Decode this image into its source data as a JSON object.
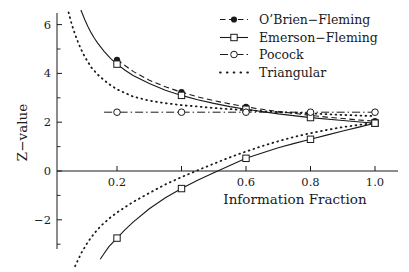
{
  "figure": {
    "width": 409,
    "height": 272,
    "background": "#ffffff",
    "ink_color": "#1a1a1a"
  },
  "chart_data": {
    "type": "line",
    "title": "",
    "xlabel": "Information Fraction",
    "ylabel": "Z−value",
    "legend_position": "top-right",
    "grid": false,
    "x_axis": {
      "range": [
        0.02,
        1.06
      ],
      "line_y_at": 0,
      "ticks": [
        {
          "v": 0.2,
          "label": "0.2"
        },
        {
          "v": 0.4,
          "label": ""
        },
        {
          "v": 0.6,
          "label": "0.6"
        },
        {
          "v": 0.8,
          "label": "0.8"
        },
        {
          "v": 1.0,
          "label": "1.0"
        }
      ]
    },
    "y_axis": {
      "range": [
        -3.2,
        6.5
      ],
      "major_ticks": [
        {
          "v": 6,
          "label": "6"
        },
        {
          "v": 4,
          "label": "4"
        },
        {
          "v": 2,
          "label": "2"
        },
        {
          "v": 0,
          "label": "0"
        },
        {
          "v": -2,
          "label": "−2"
        }
      ],
      "minor_ticks": [
        5,
        3,
        1,
        -1,
        -3
      ]
    },
    "map": {
      "x0_frac": 0.2,
      "x0_px": 117,
      "px_per_x": 322.5,
      "y0_px": 171,
      "px_per_z": 24.4,
      "x_axis_px": [
        57,
        398
      ],
      "y_axis_px": [
        13,
        249
      ]
    },
    "series": [
      {
        "name": "O’Brien−Fleming",
        "line": "dashed",
        "marker": "filled-circle",
        "branches": [
          {
            "markers": [
              [
                0.2,
                4.56
              ],
              [
                0.4,
                3.23
              ],
              [
                0.6,
                2.63
              ],
              [
                0.8,
                2.28
              ],
              [
                1.0,
                2.04
              ]
            ],
            "curve": [
              [
                0.2,
                4.56
              ],
              [
                0.25,
                4.08
              ],
              [
                0.3,
                3.72
              ],
              [
                0.35,
                3.45
              ],
              [
                0.4,
                3.23
              ],
              [
                0.45,
                3.04
              ],
              [
                0.5,
                2.88
              ],
              [
                0.55,
                2.75
              ],
              [
                0.6,
                2.63
              ],
              [
                0.65,
                2.53
              ],
              [
                0.7,
                2.44
              ],
              [
                0.75,
                2.36
              ],
              [
                0.8,
                2.28
              ],
              [
                0.85,
                2.21
              ],
              [
                0.9,
                2.15
              ],
              [
                0.95,
                2.09
              ],
              [
                1.0,
                2.04
              ]
            ]
          }
        ]
      },
      {
        "name": "Emerson−Fleming",
        "line": "solid",
        "marker": "open-square",
        "branches": [
          {
            "markers": [
              [
                0.2,
                4.38
              ],
              [
                0.4,
                3.1
              ],
              [
                0.6,
                2.53
              ],
              [
                0.8,
                2.19
              ],
              [
                1.0,
                1.96
              ]
            ],
            "curve": [
              [
                0.088,
                6.6
              ],
              [
                0.1,
                6.2
              ],
              [
                0.11,
                5.91
              ],
              [
                0.12,
                5.66
              ],
              [
                0.13,
                5.44
              ],
              [
                0.14,
                5.24
              ],
              [
                0.16,
                4.9
              ],
              [
                0.18,
                4.62
              ],
              [
                0.2,
                4.38
              ],
              [
                0.225,
                4.13
              ],
              [
                0.25,
                3.92
              ],
              [
                0.3,
                3.58
              ],
              [
                0.35,
                3.31
              ],
              [
                0.4,
                3.1
              ],
              [
                0.45,
                2.92
              ],
              [
                0.5,
                2.77
              ],
              [
                0.55,
                2.64
              ],
              [
                0.6,
                2.53
              ],
              [
                0.7,
                2.34
              ],
              [
                0.8,
                2.19
              ],
              [
                0.9,
                2.07
              ],
              [
                1.0,
                1.96
              ]
            ]
          },
          {
            "markers": [
              [
                0.2,
                -2.75
              ],
              [
                0.4,
                -0.72
              ],
              [
                0.6,
                0.52
              ],
              [
                0.8,
                1.3
              ],
              [
                1.0,
                1.96
              ]
            ],
            "curve": [
              [
                0.148,
                -3.62
              ],
              [
                0.16,
                -3.38
              ],
              [
                0.175,
                -3.1
              ],
              [
                0.2,
                -2.75
              ],
              [
                0.225,
                -2.4
              ],
              [
                0.25,
                -2.1
              ],
              [
                0.3,
                -1.55
              ],
              [
                0.35,
                -1.1
              ],
              [
                0.4,
                -0.72
              ],
              [
                0.45,
                -0.38
              ],
              [
                0.5,
                -0.07
              ],
              [
                0.55,
                0.23
              ],
              [
                0.6,
                0.52
              ],
              [
                0.65,
                0.74
              ],
              [
                0.7,
                0.95
              ],
              [
                0.75,
                1.13
              ],
              [
                0.8,
                1.3
              ],
              [
                0.85,
                1.47
              ],
              [
                0.9,
                1.64
              ],
              [
                0.95,
                1.8
              ],
              [
                1.0,
                1.96
              ]
            ]
          }
        ]
      },
      {
        "name": "Pocock",
        "line": "dashdot",
        "marker": "open-circle",
        "branches": [
          {
            "markers": [
              [
                0.2,
                2.41
              ],
              [
                0.4,
                2.41
              ],
              [
                0.6,
                2.41
              ],
              [
                0.8,
                2.41
              ],
              [
                1.0,
                2.41
              ]
            ],
            "curve": [
              [
                0.16,
                2.41
              ],
              [
                1.01,
                2.41
              ]
            ]
          }
        ]
      },
      {
        "name": "Triangular",
        "line": "dotted",
        "marker": "none",
        "branches": [
          {
            "markers": [],
            "curve": [
              [
                0.05,
                6.5
              ],
              [
                0.06,
                6.0
              ],
              [
                0.07,
                5.6
              ],
              [
                0.08,
                5.25
              ],
              [
                0.09,
                4.95
              ],
              [
                0.1,
                4.68
              ],
              [
                0.12,
                4.25
              ],
              [
                0.14,
                3.95
              ],
              [
                0.16,
                3.72
              ],
              [
                0.18,
                3.52
              ],
              [
                0.2,
                3.35
              ],
              [
                0.25,
                3.05
              ],
              [
                0.3,
                2.88
              ],
              [
                0.35,
                2.78
              ],
              [
                0.4,
                2.7
              ],
              [
                0.5,
                2.58
              ],
              [
                0.6,
                2.49
              ],
              [
                0.7,
                2.42
              ],
              [
                0.8,
                2.36
              ],
              [
                0.9,
                2.3
              ],
              [
                1.0,
                2.25
              ]
            ]
          },
          {
            "markers": [],
            "curve": [
              [
                0.07,
                -3.9
              ],
              [
                0.09,
                -3.35
              ],
              [
                0.11,
                -2.9
              ],
              [
                0.13,
                -2.55
              ],
              [
                0.15,
                -2.25
              ],
              [
                0.18,
                -1.9
              ],
              [
                0.2,
                -1.7
              ],
              [
                0.25,
                -1.27
              ],
              [
                0.3,
                -0.9
              ],
              [
                0.35,
                -0.55
              ],
              [
                0.4,
                -0.25
              ],
              [
                0.45,
                0.03
              ],
              [
                0.5,
                0.3
              ],
              [
                0.55,
                0.56
              ],
              [
                0.6,
                0.8
              ],
              [
                0.65,
                1.02
              ],
              [
                0.7,
                1.22
              ],
              [
                0.75,
                1.4
              ],
              [
                0.8,
                1.55
              ],
              [
                0.85,
                1.68
              ],
              [
                0.9,
                1.8
              ],
              [
                0.95,
                1.89
              ],
              [
                1.0,
                1.97
              ]
            ]
          }
        ]
      }
    ]
  }
}
